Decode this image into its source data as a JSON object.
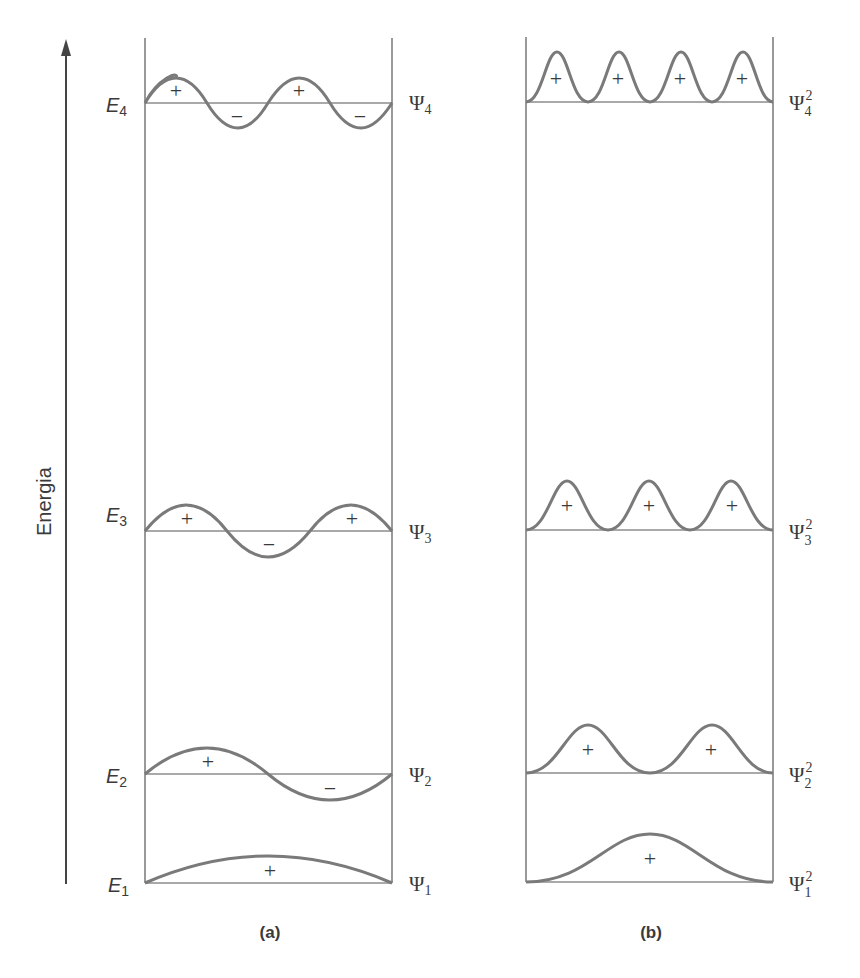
{
  "axis": {
    "label": "Energia",
    "direction": "up"
  },
  "panels": [
    {
      "caption": "(a)",
      "title": "wavefunctions",
      "levels": [
        {
          "energy_label": "E",
          "energy_sub": "4",
          "psi_label": "Ψ",
          "psi_sub": "4",
          "signs": [
            "+",
            "−",
            "+",
            "−"
          ]
        },
        {
          "energy_label": "E",
          "energy_sub": "3",
          "psi_label": "Ψ",
          "psi_sub": "3",
          "signs": [
            "+",
            "−",
            "+"
          ]
        },
        {
          "energy_label": "E",
          "energy_sub": "2",
          "psi_label": "Ψ",
          "psi_sub": "2",
          "signs": [
            "+",
            "−"
          ]
        },
        {
          "energy_label": "E",
          "energy_sub": "1",
          "psi_label": "Ψ",
          "psi_sub": "1",
          "signs": [
            "+"
          ]
        }
      ]
    },
    {
      "caption": "(b)",
      "title": "probability densities",
      "levels": [
        {
          "psi_label": "Ψ",
          "psi_sub": "4",
          "psi_sup": "2",
          "signs": [
            "+",
            "+",
            "+",
            "+"
          ]
        },
        {
          "psi_label": "Ψ",
          "psi_sub": "3",
          "psi_sup": "2",
          "signs": [
            "+",
            "+",
            "+"
          ]
        },
        {
          "psi_label": "Ψ",
          "psi_sub": "2",
          "psi_sup": "2",
          "signs": [
            "+",
            "+"
          ]
        },
        {
          "psi_label": "Ψ",
          "psi_sub": "1",
          "psi_sup": "2",
          "signs": [
            "+"
          ]
        }
      ]
    }
  ],
  "colors": {
    "curve": "#7a7a7a",
    "line": "#555555",
    "text": "#3a3a3a"
  }
}
